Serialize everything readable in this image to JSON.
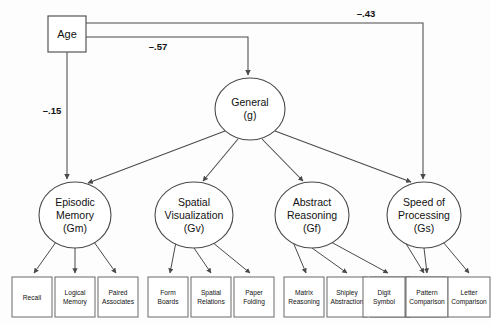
{
  "diagram": {
    "type": "structural-equation-model",
    "title": "",
    "exogenous": {
      "id": "age",
      "label": "Age",
      "shape": "rectangle",
      "x": 48,
      "y": 16,
      "w": 38,
      "h": 36
    },
    "second_order_factor": {
      "id": "g",
      "label_line1": "General",
      "label_line2": "(g)",
      "shape": "ellipse",
      "cx": 250,
      "cy": 109,
      "rx": 35,
      "ry": 31
    },
    "first_order_factors": [
      {
        "id": "gm",
        "label_line1": "Episodic",
        "label_line2": "Memory",
        "label_line3": "(Gm)",
        "shape": "ellipse",
        "cx": 75,
        "cy": 215,
        "rx": 36,
        "ry": 33
      },
      {
        "id": "gv",
        "label_line1": "Spatial",
        "label_line2": "Visualization",
        "label_line3": "(Gv)",
        "shape": "ellipse",
        "cx": 194,
        "cy": 215,
        "rx": 39,
        "ry": 33
      },
      {
        "id": "gf",
        "label_line1": "Abstract",
        "label_line2": "Reasoning",
        "label_line3": "(Gf)",
        "shape": "ellipse",
        "cx": 312,
        "cy": 215,
        "rx": 37,
        "ry": 33
      },
      {
        "id": "gs",
        "label_line1": "Speed of",
        "label_line2": "Processing",
        "label_line3": "(Gs)",
        "shape": "ellipse",
        "cx": 424,
        "cy": 215,
        "rx": 37,
        "ry": 33
      }
    ],
    "indicators": [
      {
        "id": "recall",
        "line1": "Recall",
        "line2": "",
        "x": 12,
        "y": 277,
        "w": 40,
        "h": 40,
        "factor": "gm"
      },
      {
        "id": "logical-memory",
        "line1": "Logical",
        "line2": "Memory",
        "x": 55,
        "y": 277,
        "w": 40,
        "h": 40,
        "factor": "gm"
      },
      {
        "id": "paired-associates",
        "line1": "Paired",
        "line2": "Associates",
        "x": 98,
        "y": 277,
        "w": 40,
        "h": 40,
        "factor": "gm"
      },
      {
        "id": "form-boards",
        "line1": "Form",
        "line2": "Boards",
        "x": 148,
        "y": 277,
        "w": 40,
        "h": 40,
        "factor": "gv"
      },
      {
        "id": "spatial-relations",
        "line1": "Spatial",
        "line2": "Relations",
        "x": 191,
        "y": 277,
        "w": 40,
        "h": 40,
        "factor": "gv"
      },
      {
        "id": "paper-folding",
        "line1": "Paper",
        "line2": "Folding",
        "x": 234,
        "y": 277,
        "w": 40,
        "h": 40,
        "factor": "gv"
      },
      {
        "id": "matrix-reasoning",
        "line1": "Matrix",
        "line2": "Reasoning",
        "x": 284,
        "y": 277,
        "w": 40,
        "h": 40,
        "factor": "gf"
      },
      {
        "id": "shipley-abstraction",
        "line1": "Shipley",
        "line2": "Abstraction",
        "x": 327,
        "y": 277,
        "w": 40,
        "h": 40,
        "factor": "gf"
      },
      {
        "id": "letter-sets",
        "line1": "Letter",
        "line2": "Sets",
        "x": 370,
        "y": 277,
        "w": 40,
        "h": 40,
        "factor": "gf"
      },
      {
        "id": "digit-symbol",
        "line1": "Digit",
        "line2": "Symbol",
        "x": 403,
        "y": 277,
        "w": 40,
        "h": 40,
        "factor": "gs"
      },
      {
        "id": "pattern-comparison",
        "line1": "Pattern",
        "line2": "Comparison",
        "x": 406,
        "y": 277,
        "w": 42,
        "h": 40,
        "factor": "gs"
      },
      {
        "id": "letter-comparison",
        "line1": "Letter",
        "line2": "Comparison",
        "x": 448,
        "y": 277,
        "w": 42,
        "h": 40,
        "factor": "gs"
      }
    ],
    "paths": [
      {
        "id": "age-to-g",
        "from": "age",
        "to": "g",
        "coefficient": "–.57",
        "label_x": 158,
        "label_y": 50
      },
      {
        "id": "age-to-gs",
        "from": "age",
        "to": "gs",
        "coefficient": "–.43",
        "label_x": 366,
        "label_y": 17
      },
      {
        "id": "age-to-gm",
        "from": "age",
        "to": "gm",
        "coefficient": "–.15",
        "label_x": 52,
        "label_y": 114
      }
    ]
  }
}
